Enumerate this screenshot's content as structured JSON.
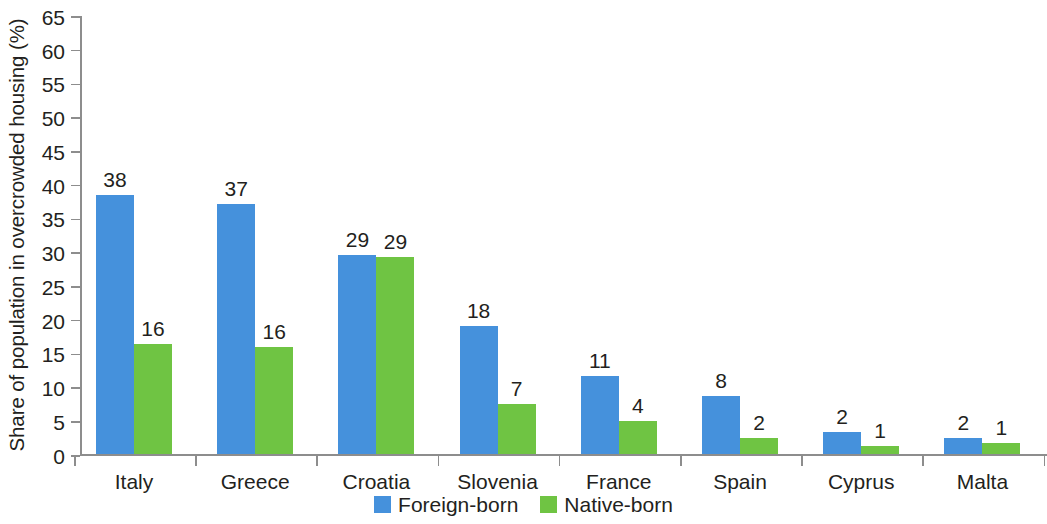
{
  "chart_data": {
    "type": "bar",
    "title": "",
    "subtitle": "",
    "xlabel": "",
    "ylabel": "Share of population in overcrowded housing (%)",
    "ylim": [
      0,
      65
    ],
    "ytick_step": 5,
    "yticks": [
      0,
      5,
      10,
      15,
      20,
      25,
      30,
      35,
      40,
      45,
      50,
      55,
      60,
      65
    ],
    "grid": false,
    "legend_position": "bottom",
    "categories": [
      "Italy",
      "Greece",
      "Croatia",
      "Slovenia",
      "France",
      "Spain",
      "Cyprus",
      "Malta"
    ],
    "series": [
      {
        "name": "Foreign-born",
        "color": "#4591dc",
        "values": [
          38,
          37,
          29,
          18,
          11,
          8,
          2,
          2
        ],
        "plotted_values": [
          38.3,
          37.0,
          29.5,
          18.9,
          11.6,
          8.6,
          3.2,
          2.4
        ]
      },
      {
        "name": "Native-born",
        "color": "#6fc443",
        "values": [
          16,
          16,
          29,
          7,
          4,
          2,
          1,
          1
        ],
        "plotted_values": [
          16.3,
          15.8,
          29.1,
          7.4,
          4.9,
          2.4,
          1.2,
          1.7
        ]
      }
    ]
  },
  "legend": {
    "items": [
      {
        "label": "Foreign-born",
        "color": "#4591dc"
      },
      {
        "label": "Native-born",
        "color": "#6fc443"
      }
    ]
  },
  "axis": {
    "y_title": "Share of population in overcrowded housing (%)"
  }
}
